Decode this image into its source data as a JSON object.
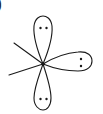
{
  "diagram": {
    "label": ")",
    "stroke_color": "#1a1a1a",
    "background": "#ffffff",
    "center": {
      "x": 43,
      "y": 64
    },
    "lobes": [
      {
        "name": "top",
        "lone_pair": ":"
      },
      {
        "name": "right",
        "lone_pair": ":"
      },
      {
        "name": "bottom",
        "lone_pair": ":"
      }
    ],
    "bonds": [
      {
        "name": "upper-left"
      },
      {
        "name": "lower-left"
      }
    ]
  }
}
